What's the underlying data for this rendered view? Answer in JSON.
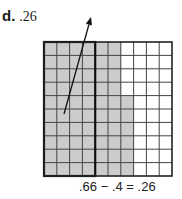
{
  "problem": {
    "label": "d.",
    "answer": ".26"
  },
  "grid": {
    "rows": 10,
    "cols": 10,
    "x": 44,
    "y": 42,
    "width": 128,
    "height": 134,
    "shaded_full_columns": 6,
    "partial_column_index": 6,
    "partial_column_shaded_from_row": 4,
    "outlined_columns": 4,
    "shade_color": "#cccccc",
    "line_color": "#444444"
  },
  "arrow": {
    "from": [
      64,
      114
    ],
    "to": [
      91,
      17
    ]
  },
  "caption": ".66 − .4 = .26"
}
